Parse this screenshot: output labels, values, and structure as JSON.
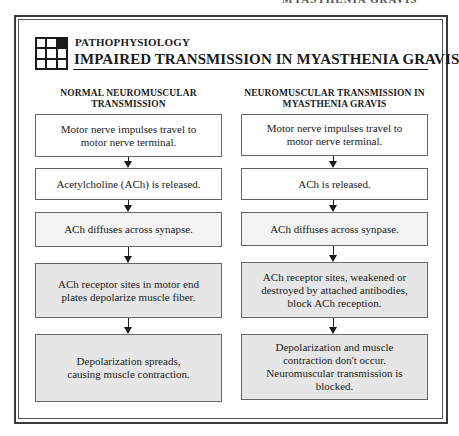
{
  "running_head": "MYASTHENIA GRAVIS",
  "header": {
    "kicker": "PATHOPHYSIOLOGY",
    "title": "IMPAIRED TRANSMISSION IN MYASTHENIA GRAVIS",
    "icon": "grid-icon"
  },
  "columns": {
    "left": {
      "heading_line1": "NORMAL NEUROMUSCULAR",
      "heading_line2": "TRANSMISSION",
      "steps": [
        {
          "text": "Motor nerve impulses travel to motor nerve terminal.",
          "fill": "white"
        },
        {
          "text": "Acetylcholine (ACh) is released.",
          "fill": "white"
        },
        {
          "text": "ACh diffuses across synapse.",
          "fill": "light"
        },
        {
          "text": "ACh receptor sites in motor end plates depolarize muscle fiber.",
          "fill": "gray"
        },
        {
          "text": "Depolarization spreads, causing muscle contraction.",
          "fill": "gray"
        }
      ]
    },
    "right": {
      "heading_line1": "NEUROMUSCULAR TRANSMISSION IN",
      "heading_line2": "MYASTHENIA GRAVIS",
      "steps": [
        {
          "text": "Motor nerve impulses travel to motor nerve terminal.",
          "fill": "white"
        },
        {
          "text": "ACh is released.",
          "fill": "white"
        },
        {
          "text": "ACh diffuses across synpase.",
          "fill": "light"
        },
        {
          "text": "ACh receptor sites, weakened or destroyed by attached antibodies, block ACh reception.",
          "fill": "gray"
        },
        {
          "text": "Depolarization and muscle contraction don't occur. Neuromuscular transmission is blocked.",
          "fill": "gray"
        }
      ]
    }
  },
  "colors": {
    "frame": "#3a3a3a",
    "box_border": "#666666",
    "fill_white": "#ffffff",
    "fill_light": "#f3f3f3",
    "fill_gray": "#e6e6e6",
    "text": "#1a1a1a"
  }
}
